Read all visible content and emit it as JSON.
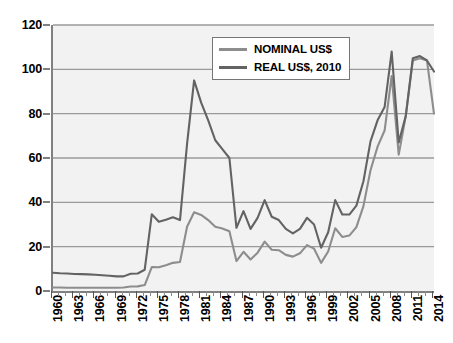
{
  "chart_data": {
    "type": "line",
    "title": "",
    "xlabel": "",
    "ylabel": "",
    "xlim": [
      1960,
      2014
    ],
    "ylim": [
      0,
      120
    ],
    "grid": true,
    "legend_position": "top-center-right",
    "y_ticks": [
      0,
      20,
      40,
      60,
      80,
      100,
      120
    ],
    "y_tick_labels": [
      "0",
      "20",
      "40",
      "60",
      "80",
      "100",
      "120"
    ],
    "x_tick_labels": [
      "1960",
      "1963",
      "1966",
      "1969",
      "1972",
      "1975",
      "1978",
      "1981",
      "1984",
      "1987",
      "1990",
      "1993",
      "1996",
      "1999",
      "2002",
      "2005",
      "2008",
      "2011",
      "2014"
    ],
    "x": [
      1960,
      1961,
      1962,
      1963,
      1964,
      1965,
      1966,
      1967,
      1968,
      1969,
      1970,
      1971,
      1972,
      1973,
      1974,
      1975,
      1976,
      1977,
      1978,
      1979,
      1980,
      1981,
      1982,
      1983,
      1984,
      1985,
      1986,
      1987,
      1988,
      1989,
      1990,
      1991,
      1992,
      1993,
      1994,
      1995,
      1996,
      1997,
      1998,
      1999,
      2000,
      2001,
      2002,
      2003,
      2004,
      2005,
      2006,
      2007,
      2008,
      2009,
      2010,
      2011,
      2012,
      2013,
      2014
    ],
    "series": [
      {
        "name": "NOMINAL US$",
        "color": "#8d8d8d",
        "values": [
          1.6,
          1.6,
          1.5,
          1.5,
          1.5,
          1.5,
          1.5,
          1.5,
          1.5,
          1.5,
          1.6,
          2.0,
          2.1,
          2.7,
          10.8,
          10.7,
          11.6,
          12.7,
          13.1,
          29.0,
          35.5,
          34.3,
          32.0,
          29.0,
          28.2,
          27.0,
          13.5,
          17.7,
          14.2,
          17.3,
          22.3,
          18.6,
          18.4,
          16.3,
          15.5,
          17.0,
          20.7,
          19.1,
          12.7,
          17.8,
          28.3,
          24.4,
          25.0,
          28.8,
          38.3,
          54.5,
          65.1,
          72.4,
          97.0,
          61.5,
          79.0,
          104.0,
          105.0,
          104.0,
          80.0
        ]
      },
      {
        "name": "REAL US$, 2010",
        "color": "#636363",
        "values": [
          8.2,
          8.0,
          7.9,
          7.7,
          7.6,
          7.5,
          7.3,
          7.1,
          6.9,
          6.6,
          6.6,
          7.8,
          7.9,
          9.6,
          34.6,
          31.2,
          32.1,
          33.3,
          32.0,
          66.4,
          95.0,
          85.0,
          77.0,
          68.0,
          64.0,
          60.0,
          28.5,
          36.0,
          28.0,
          33.0,
          41.0,
          33.5,
          32.0,
          28.0,
          26.0,
          28.0,
          33.0,
          30.0,
          19.5,
          26.5,
          41.0,
          34.5,
          34.5,
          38.5,
          49.5,
          67.5,
          77.0,
          83.0,
          108.0,
          67.0,
          79.0,
          105.0,
          106.0,
          104.0,
          99.0
        ]
      }
    ],
    "annotations": []
  },
  "legend": {
    "items": [
      {
        "label": "NOMINAL US$",
        "color": "#8d8d8d"
      },
      {
        "label": "REAL US$, 2010",
        "color": "#636363"
      }
    ]
  },
  "colors": {
    "plot_background": "#f2f2f2",
    "gridline": "#9a9a9a",
    "axis": "#808080",
    "text": "#000000",
    "nominal": "#8d8d8d",
    "real": "#636363"
  }
}
